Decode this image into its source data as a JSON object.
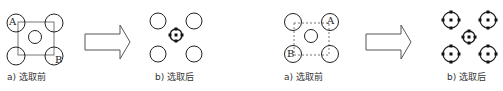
{
  "panels": [
    {
      "id": "left-before",
      "caption": "a) 选取前",
      "labels": {
        "top_left": "A",
        "bottom_right": "B"
      },
      "selection_box": "solid"
    },
    {
      "id": "left-after",
      "caption": "b) 选取后",
      "selected": [
        "center"
      ]
    },
    {
      "id": "right-before",
      "caption": "a) 选取前",
      "labels": {
        "top_right": "A",
        "bottom_left": "B"
      },
      "selection_box": "dashed"
    },
    {
      "id": "right-after",
      "caption": "b) 选取后",
      "selected": [
        "top-left",
        "top-right",
        "center",
        "bottom-left",
        "bottom-right"
      ]
    }
  ],
  "arrows": [
    "right-arrow",
    "right-arrow"
  ],
  "colors": {
    "stroke": "#222222",
    "box": "#777777",
    "text": "#333333"
  }
}
